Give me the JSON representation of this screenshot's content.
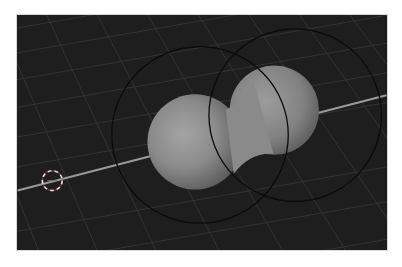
{
  "viewport": {
    "label": "3D viewport",
    "background": "#1e1e1e",
    "grid_color": "#3a3a3a",
    "x_axis_color": "#9a9a9a"
  },
  "scene": {
    "objects": [
      {
        "name": "metaball-left",
        "type": "metaball",
        "cx": 179,
        "cy": 128,
        "r": 48
      },
      {
        "name": "metaball-right",
        "type": "metaball",
        "cx": 259,
        "cy": 96,
        "r": 45
      }
    ],
    "influence_circles": [
      {
        "name": "influence-circle-left",
        "cx": 184,
        "cy": 121,
        "r": 89
      },
      {
        "name": "influence-circle-right",
        "cx": 280,
        "cy": 101,
        "r": 87
      }
    ],
    "cursor_3d": {
      "cx": 35,
      "cy": 167,
      "r": 10
    }
  }
}
